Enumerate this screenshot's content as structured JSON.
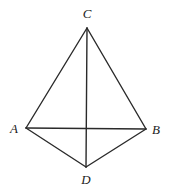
{
  "diagram": {
    "type": "geometry",
    "points": {
      "A": {
        "label": "A",
        "x": 26,
        "y": 128,
        "lx": 14,
        "ly": 133
      },
      "B": {
        "label": "B",
        "x": 146,
        "y": 129,
        "lx": 156,
        "ly": 134
      },
      "C": {
        "label": "C",
        "x": 87,
        "y": 28,
        "lx": 87,
        "ly": 18
      },
      "D": {
        "label": "D",
        "x": 86,
        "y": 167,
        "lx": 86,
        "ly": 184
      }
    },
    "segments": [
      [
        "A",
        "C"
      ],
      [
        "C",
        "B"
      ],
      [
        "A",
        "B"
      ],
      [
        "A",
        "D"
      ],
      [
        "D",
        "B"
      ],
      [
        "C",
        "D"
      ]
    ],
    "stroke_color": "#2a2a2a",
    "background": "#ffffff"
  }
}
